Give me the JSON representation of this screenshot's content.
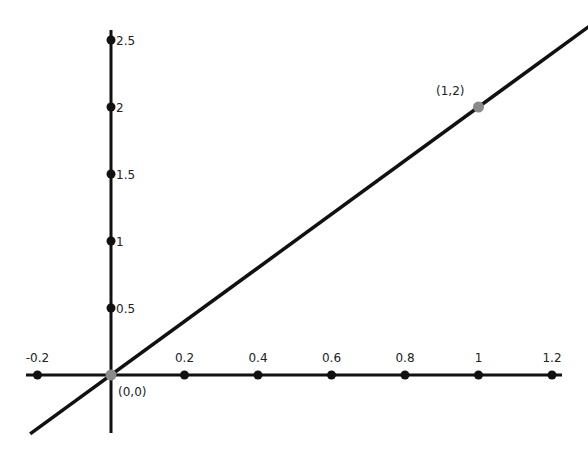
{
  "chart_data": {
    "type": "line",
    "title": "",
    "xlabel": "",
    "ylabel": "",
    "xlim": [
      -0.2,
      1.2
    ],
    "ylim": [
      0,
      2.5
    ],
    "grid": false,
    "legend": null,
    "x_ticks": [
      -0.2,
      0.2,
      0.4,
      0.6,
      0.8,
      1,
      1.2
    ],
    "x_tick_labels": [
      "-0.2",
      "0.2",
      "0.4",
      "0.6",
      "0.8",
      "1",
      "1.2"
    ],
    "y_ticks": [
      0.5,
      1,
      1.5,
      2,
      2.5
    ],
    "y_tick_labels": [
      "0.5",
      "1",
      "1.5",
      "2",
      "2.5"
    ],
    "series": [
      {
        "name": "y = 2x",
        "x": [
          -0.22,
          1.3
        ],
        "y": [
          -0.44,
          2.6
        ],
        "color": "#111111"
      }
    ],
    "points": [
      {
        "x": 0,
        "y": 0,
        "label": "(0,0)",
        "color": "#8a8a8a"
      },
      {
        "x": 1,
        "y": 2,
        "label": "(1,2)",
        "color": "#8a8a8a"
      }
    ]
  },
  "style": {
    "axis_color": "#111111",
    "tick_dot_color": "#111111",
    "line_color": "#111111",
    "highlight_point_color": "#8a8a8a"
  }
}
